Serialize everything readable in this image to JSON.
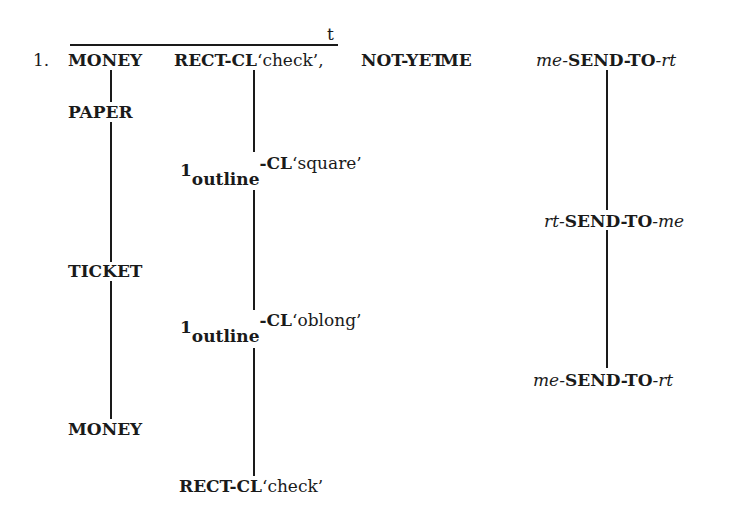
{
  "example": {
    "number": "1.",
    "topic_marker": "t",
    "line1": {
      "money": "MONEY",
      "rect_cl": {
        "gloss_sign": "RECT-CL",
        "gloss": "‘check’,"
      },
      "not_yet": "NOT-YET",
      "me": "ME",
      "send": {
        "prefix": "me-",
        "verb": "SEND-TO",
        "suffix": "-rt"
      }
    },
    "column1": {
      "items": [
        "PAPER",
        "TICKET",
        "MONEY"
      ]
    },
    "column2": {
      "items": [
        {
          "handshape": "1",
          "subscript": "outline",
          "classifier": "-CL",
          "gloss": "‘square’"
        },
        {
          "handshape": "1",
          "subscript": "outline",
          "classifier": "-CL",
          "gloss": "‘oblong’"
        },
        {
          "sign": "RECT-CL",
          "gloss": "‘check’"
        }
      ]
    },
    "column3": {
      "items": [
        {
          "prefix": "rt-",
          "verb": "SEND-TO",
          "suffix": "-me"
        },
        {
          "prefix": "me-",
          "verb": "SEND-TO",
          "suffix": "-rt"
        }
      ]
    }
  }
}
